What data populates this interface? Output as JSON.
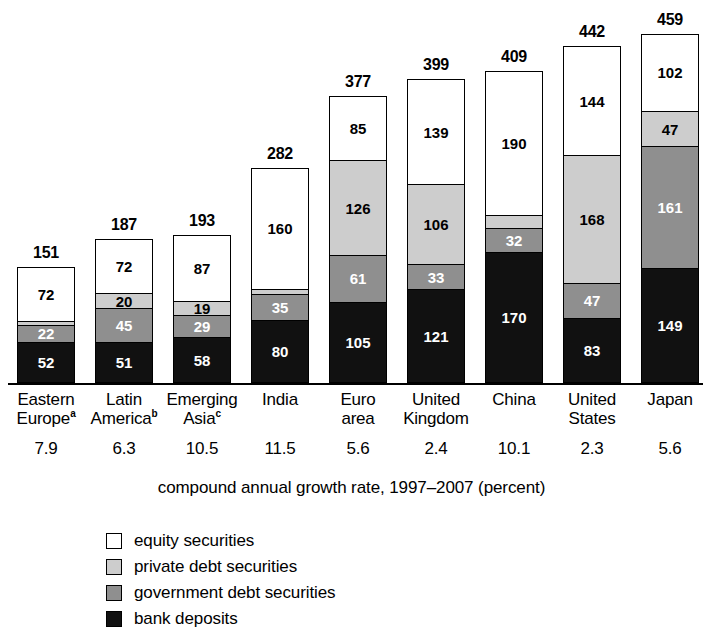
{
  "chart_data": {
    "type": "bar",
    "title": "",
    "subtitle": "",
    "xlabel": "compound annual growth rate, 1997–2007 (percent)",
    "ylabel": "",
    "stacked": true,
    "grid": false,
    "legend_position": "bottom-left",
    "ylim": [
      0,
      459
    ],
    "value_axis_note": "stacked totals shown above each bar; segment values shown inside segments",
    "categories": [
      "Eastern Europe",
      "Latin America",
      "Emerging Asia",
      "India",
      "Euro area",
      "United Kingdom",
      "China",
      "United States",
      "Japan"
    ],
    "category_footnotes": [
      "a",
      "b",
      "c",
      "",
      "",
      "",
      "",
      "",
      ""
    ],
    "category_lines": [
      [
        "Eastern",
        "Europe"
      ],
      [
        "Latin",
        "America"
      ],
      [
        "Emerging",
        "Asia"
      ],
      [
        "India",
        ""
      ],
      [
        "Euro",
        "area"
      ],
      [
        "United",
        "Kingdom"
      ],
      [
        "China",
        ""
      ],
      [
        "United",
        "States"
      ],
      [
        "Japan",
        ""
      ]
    ],
    "growth_rates": [
      "7.9",
      "6.3",
      "10.5",
      "11.5",
      "5.6",
      "2.4",
      "10.1",
      "2.3",
      "5.6"
    ],
    "totals": [
      151,
      187,
      193,
      282,
      377,
      399,
      409,
      442,
      459
    ],
    "series": [
      {
        "name": "bank deposits",
        "color": "#111111",
        "values": [
          52,
          51,
          58,
          80,
          105,
          121,
          170,
          83,
          149
        ],
        "labels": [
          "52",
          "51",
          "58",
          "80",
          "105",
          "121",
          "170",
          "83",
          "149"
        ]
      },
      {
        "name": "government debt securities",
        "color": "#8f8f8f",
        "values": [
          22,
          45,
          29,
          35,
          61,
          33,
          32,
          47,
          161
        ],
        "labels": [
          "22",
          "45",
          "29",
          "35",
          "61",
          "33",
          "32",
          "47",
          "161"
        ]
      },
      {
        "name": "private debt securities",
        "color": "#cdcdcd",
        "values": [
          5,
          20,
          19,
          7,
          126,
          106,
          17,
          168,
          47
        ],
        "labels": [
          "",
          "20",
          "19",
          "",
          "126",
          "106",
          "",
          "168",
          "47"
        ]
      },
      {
        "name": "equity securities",
        "color": "#ffffff",
        "values": [
          72,
          72,
          87,
          160,
          85,
          139,
          190,
          144,
          102
        ],
        "labels": [
          "72",
          "72",
          "87",
          "160",
          "85",
          "139",
          "190",
          "144",
          "102"
        ]
      }
    ]
  },
  "legend": {
    "items": [
      {
        "label": "equity securities",
        "color": "#ffffff",
        "key": "equity"
      },
      {
        "label": "private debt securities",
        "color": "#cdcdcd",
        "key": "private"
      },
      {
        "label": "government debt securities",
        "color": "#8f8f8f",
        "key": "govt"
      },
      {
        "label": "bank deposits",
        "color": "#111111",
        "key": "bank"
      }
    ]
  },
  "axis": {
    "caption": "compound annual growth rate, 1997–2007 (percent)"
  }
}
